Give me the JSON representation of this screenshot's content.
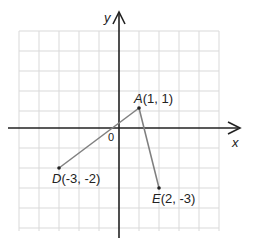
{
  "diagram": {
    "type": "coordinate-plane",
    "grid": {
      "x_range": [
        -5,
        5
      ],
      "y_range": [
        -5,
        5
      ],
      "cell_size_px": 20,
      "grid_color": "#d9d9d9"
    },
    "axes": {
      "x_label": "x",
      "y_label": "y",
      "origin_label": "0",
      "axis_color": "#222222"
    },
    "points": [
      {
        "name": "A",
        "coords": "(1, 1)",
        "x": 1,
        "y": 1
      },
      {
        "name": "D",
        "coords": "(-3, -2)",
        "x": -3,
        "y": -2
      },
      {
        "name": "E",
        "coords": "(2, -3)",
        "x": 2,
        "y": -3
      }
    ],
    "segments": [
      {
        "from": "A",
        "to": "D"
      },
      {
        "from": "A",
        "to": "E"
      }
    ],
    "segment_color": "#7f7f7f"
  }
}
